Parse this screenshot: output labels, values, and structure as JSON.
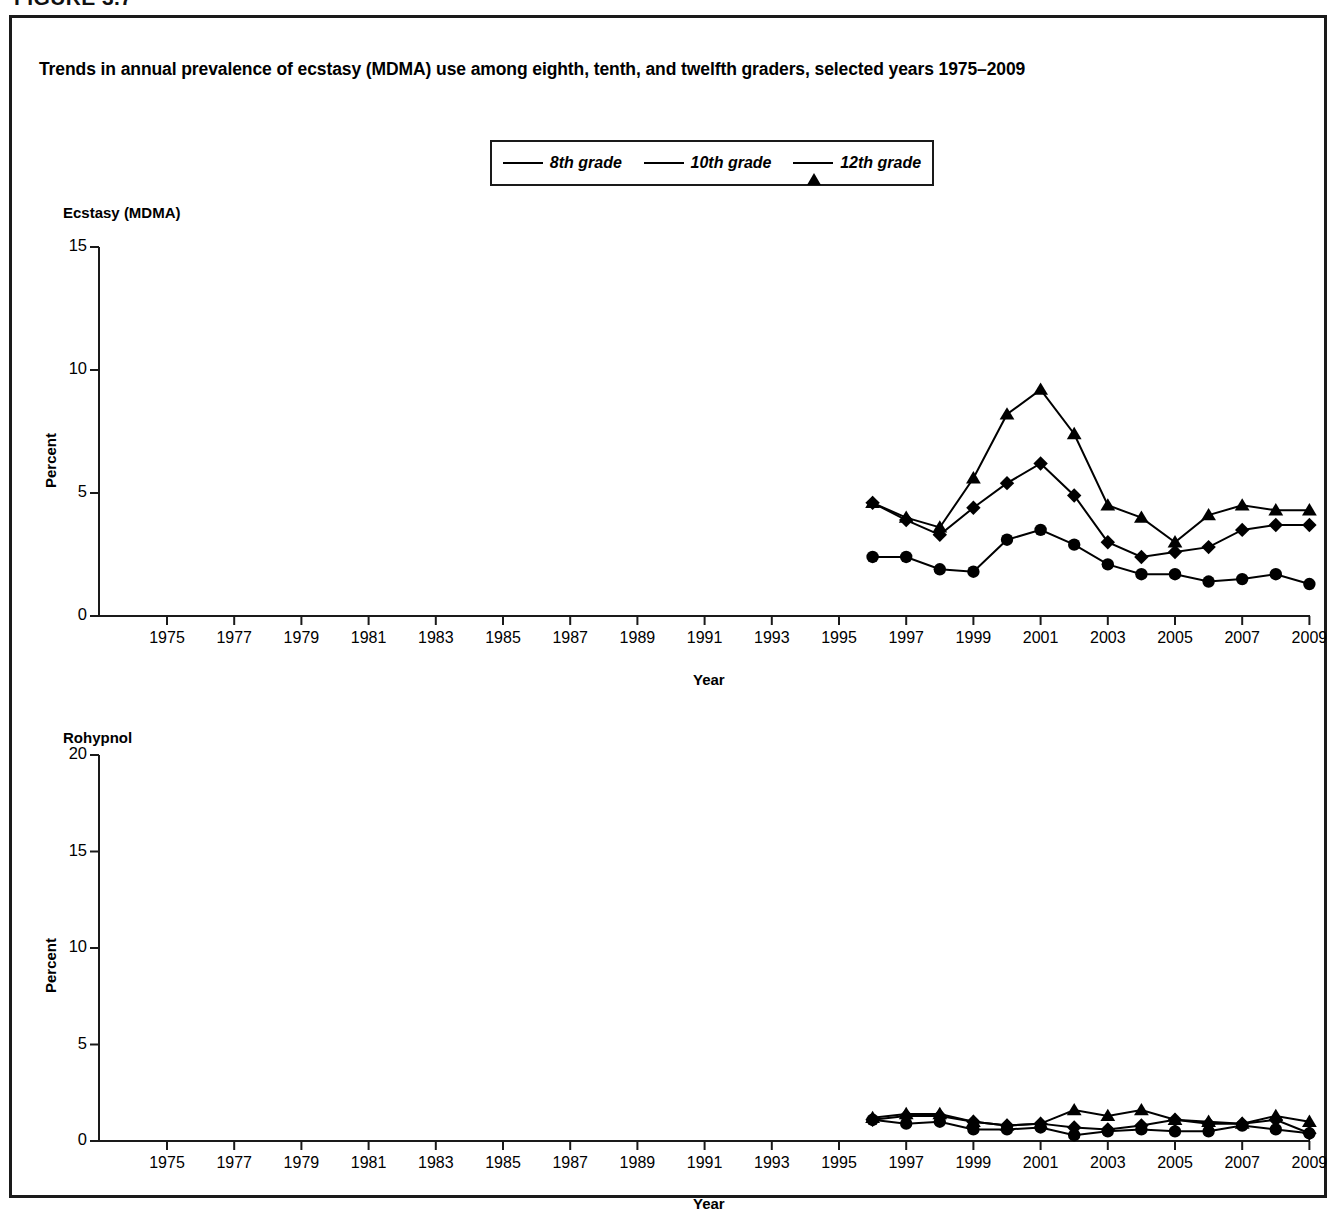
{
  "figure_tag": "FIGURE 3.7",
  "chart_title": "Trends in annual prevalence of ecstasy (MDMA) use among eighth, tenth, and twelfth graders, selected years 1975–2009",
  "legend": {
    "items": [
      {
        "label": "8th grade",
        "marker": "circle-marker"
      },
      {
        "label": "10th grade",
        "marker": "diamond-marker"
      },
      {
        "label": "12th grade",
        "marker": "triangle-marker"
      }
    ]
  },
  "axis_label_x": "Year",
  "axis_label_y": "Percent",
  "chart_data": [
    {
      "type": "line",
      "title": "Ecstasy (MDMA)",
      "xlabel": "Year",
      "ylabel": "Percent",
      "xlim": [
        1974,
        2009
      ],
      "ylim": [
        0,
        15
      ],
      "yticks": [
        0,
        5,
        10,
        15
      ],
      "ytick_labels": [
        "0",
        "5",
        "10",
        "15"
      ],
      "xticks": [
        1975,
        1977,
        1979,
        1981,
        1983,
        1985,
        1987,
        1989,
        1991,
        1993,
        1995,
        1997,
        1999,
        2001,
        2003,
        2005,
        2007,
        2009
      ],
      "xtick_labels": [
        "1975",
        "1977",
        "1979",
        "1981",
        "1983",
        "1985",
        "1987",
        "1989",
        "1991",
        "1993",
        "1995",
        "1997",
        "1999",
        "2001",
        "2003",
        "2005",
        "2007",
        "2009"
      ],
      "grid": false,
      "legend_position": "top-center",
      "x": [
        1996,
        1997,
        1998,
        1999,
        2000,
        2001,
        2002,
        2003,
        2004,
        2005,
        2006,
        2007,
        2008,
        2009
      ],
      "series": [
        {
          "name": "8th grade",
          "marker": "circle",
          "values": [
            2.4,
            2.4,
            1.9,
            1.8,
            3.1,
            3.5,
            2.9,
            2.1,
            1.7,
            1.7,
            1.4,
            1.5,
            1.7,
            1.3
          ]
        },
        {
          "name": "10th grade",
          "marker": "diamond",
          "values": [
            4.6,
            3.9,
            3.3,
            4.4,
            5.4,
            6.2,
            4.9,
            3.0,
            2.4,
            2.6,
            2.8,
            3.5,
            3.7,
            3.7
          ]
        },
        {
          "name": "12th grade",
          "marker": "triangle",
          "values": [
            4.6,
            4.0,
            3.6,
            5.6,
            8.2,
            9.2,
            7.4,
            4.5,
            4.0,
            3.0,
            4.1,
            4.5,
            4.3,
            4.3
          ]
        }
      ]
    },
    {
      "type": "line",
      "title": "Rohypnol",
      "xlabel": "Year",
      "ylabel": "Percent",
      "xlim": [
        1974,
        2009
      ],
      "ylim": [
        0,
        20
      ],
      "yticks": [
        0,
        5,
        10,
        15,
        20
      ],
      "ytick_labels": [
        "0",
        "5",
        "10",
        "15",
        "20"
      ],
      "xticks": [
        1975,
        1977,
        1979,
        1981,
        1983,
        1985,
        1987,
        1989,
        1991,
        1993,
        1995,
        1997,
        1999,
        2001,
        2003,
        2005,
        2007,
        2009
      ],
      "xtick_labels": [
        "1975",
        "1977",
        "1979",
        "1981",
        "1983",
        "1985",
        "1987",
        "1989",
        "1991",
        "1993",
        "1995",
        "1997",
        "1999",
        "2001",
        "2003",
        "2005",
        "2007",
        "2009"
      ],
      "grid": false,
      "legend_position": "top-center",
      "x": [
        1996,
        1997,
        1998,
        1999,
        2000,
        2001,
        2002,
        2003,
        2004,
        2005,
        2006,
        2007,
        2008,
        2009
      ],
      "series": [
        {
          "name": "8th grade",
          "marker": "circle",
          "values": [
            1.1,
            0.9,
            1.0,
            0.6,
            0.6,
            0.7,
            0.3,
            0.5,
            0.6,
            0.5,
            0.5,
            0.8,
            0.6,
            0.4
          ]
        },
        {
          "name": "10th grade",
          "marker": "diamond",
          "values": [
            1.1,
            1.3,
            1.3,
            1.0,
            0.8,
            0.9,
            0.7,
            0.6,
            0.8,
            1.1,
            0.9,
            0.9,
            1.1,
            0.4
          ]
        },
        {
          "name": "12th grade",
          "marker": "triangle",
          "values": [
            1.2,
            1.4,
            1.4,
            1.0,
            0.8,
            0.9,
            1.6,
            1.3,
            1.6,
            1.1,
            1.0,
            0.9,
            1.3,
            1.0
          ]
        }
      ]
    }
  ]
}
